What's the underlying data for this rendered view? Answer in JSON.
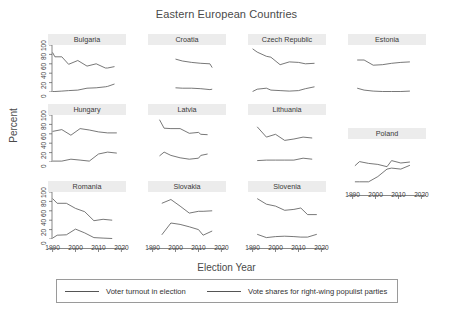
{
  "chart_data": {
    "type": "line",
    "title": "Eastern European Countries",
    "xlabel": "Election Year",
    "ylabel": "Percent",
    "xlim": [
      1988,
      2022
    ],
    "ylim": [
      0,
      100
    ],
    "xticks": [
      "1990",
      "2000",
      "2010",
      "2020"
    ],
    "yticks": [
      "0",
      "20",
      "40",
      "60",
      "80",
      "100"
    ],
    "grid": false,
    "legend_position": "bottom",
    "legend": [
      {
        "name": "Voter turnout in election"
      },
      {
        "name": "Vote shares for right-wing populist parties"
      }
    ],
    "layout": {
      "rows": 3,
      "cols": 4,
      "note": "small-multiples / faceted by country"
    },
    "panels": [
      {
        "country": "Bulgaria",
        "series": [
          {
            "name": "Voter turnout in election",
            "x": [
              1990,
              1991,
              1994,
              1997,
              2001,
              2005,
              2009,
              2013,
              2014,
              2017
            ],
            "values": [
              84,
              75,
              75,
              59,
              67,
              55,
              60,
              51,
              51,
              54
            ]
          },
          {
            "name": "Vote shares for right-wing populist parties",
            "x": [
              1990,
              1991,
              1994,
              1997,
              2001,
              2005,
              2009,
              2013,
              2014,
              2017
            ],
            "values": [
              1,
              1,
              2,
              3,
              4,
              8,
              9,
              11,
              12,
              17
            ]
          }
        ]
      },
      {
        "country": "Croatia",
        "series": [
          {
            "name": "Voter turnout in election",
            "x": [
              2000,
              2003,
              2007,
              2011,
              2015,
              2016
            ],
            "values": [
              70,
              66,
              63,
              61,
              60,
              52
            ]
          },
          {
            "name": "Vote shares for right-wing populist parties",
            "x": [
              2000,
              2003,
              2007,
              2011,
              2015,
              2016
            ],
            "values": [
              9,
              8,
              8,
              7,
              5,
              6
            ]
          }
        ]
      },
      {
        "country": "Czech Republic",
        "series": [
          {
            "name": "Voter turnout in election",
            "x": [
              1990,
              1992,
              1996,
              1998,
              2002,
              2006,
              2010,
              2013,
              2017
            ],
            "values": [
              92,
              85,
              76,
              74,
              58,
              64,
              63,
              60,
              61
            ]
          },
          {
            "name": "Vote shares for right-wing populist parties",
            "x": [
              1990,
              1992,
              1996,
              1998,
              2002,
              2006,
              2010,
              2013,
              2017
            ],
            "values": [
              1,
              6,
              8,
              4,
              3,
              2,
              3,
              7,
              11
            ]
          }
        ]
      },
      {
        "country": "Estonia",
        "series": [
          {
            "name": "Voter turnout in election",
            "x": [
              1992,
              1995,
              1999,
              2003,
              2007,
              2011,
              2015
            ],
            "values": [
              68,
              68,
              57,
              58,
              61,
              63,
              64
            ]
          },
          {
            "name": "Vote shares for right-wing populist parties",
            "x": [
              1992,
              1995,
              1999,
              2003,
              2007,
              2011,
              2015
            ],
            "values": [
              8,
              4,
              2,
              1,
              1,
              1,
              2
            ]
          }
        ]
      },
      {
        "country": "Hungary",
        "series": [
          {
            "name": "Voter turnout in election",
            "x": [
              1990,
              1994,
              1998,
              2002,
              2006,
              2010,
              2014,
              2018
            ],
            "values": [
              65,
              69,
              57,
              71,
              68,
              64,
              62,
              62
            ]
          },
          {
            "name": "Vote shares for right-wing populist parties",
            "x": [
              1990,
              1994,
              1998,
              2002,
              2006,
              2010,
              2014,
              2018
            ],
            "values": [
              2,
              2,
              6,
              4,
              2,
              17,
              21,
              19
            ]
          }
        ]
      },
      {
        "country": "Latvia",
        "series": [
          {
            "name": "Voter turnout in election",
            "x": [
              1993,
              1995,
              1998,
              2002,
              2006,
              2010,
              2011,
              2014
            ],
            "values": [
              90,
              72,
              71,
              71,
              61,
              63,
              59,
              58
            ]
          },
          {
            "name": "Vote shares for right-wing populist parties",
            "x": [
              1993,
              1995,
              1998,
              2002,
              2006,
              2010,
              2011,
              2014
            ],
            "values": [
              13,
              21,
              14,
              9,
              6,
              8,
              14,
              17
            ]
          }
        ]
      },
      {
        "country": "Lithuania",
        "series": [
          {
            "name": "Voter turnout in election",
            "x": [
              1992,
              1996,
              2000,
              2004,
              2008,
              2012,
              2016
            ],
            "values": [
              75,
              53,
              59,
              46,
              49,
              53,
              51
            ]
          },
          {
            "name": "Vote shares for right-wing populist parties",
            "x": [
              1992,
              1996,
              2000,
              2004,
              2008,
              2012,
              2016
            ],
            "values": [
              3,
              4,
              4,
              4,
              4,
              8,
              6
            ]
          }
        ]
      },
      {
        "country": "Poland",
        "series": [
          {
            "name": "Voter turnout in election",
            "x": [
              1991,
              1993,
              1997,
              2001,
              2005,
              2007,
              2011,
              2015
            ],
            "values": [
              43,
              52,
              48,
              46,
              41,
              54,
              49,
              51
            ]
          },
          {
            "name": "Vote shares for right-wing populist parties",
            "x": [
              1991,
              1993,
              1997,
              2001,
              2005,
              2007,
              2011,
              2015
            ],
            "values": [
              9,
              9,
              9,
              20,
              36,
              38,
              36,
              44
            ]
          }
        ]
      },
      {
        "country": "Romania",
        "series": [
          {
            "name": "Voter turnout in election",
            "x": [
              1990,
              1992,
              1996,
              2000,
              2004,
              2008,
              2012,
              2016
            ],
            "values": [
              86,
              76,
              76,
              65,
              58,
              39,
              42,
              40
            ]
          },
          {
            "name": "Vote shares for right-wing populist parties",
            "x": [
              1990,
              1992,
              1996,
              2000,
              2004,
              2008,
              2012,
              2016
            ],
            "values": [
              2,
              8,
              9,
              21,
              13,
              3,
              2,
              1
            ]
          }
        ]
      },
      {
        "country": "Slovakia",
        "series": [
          {
            "name": "Voter turnout in election",
            "x": [
              1994,
              1998,
              2002,
              2006,
              2010,
              2012,
              2016
            ],
            "values": [
              76,
              84,
              70,
              55,
              59,
              59,
              60
            ]
          },
          {
            "name": "Vote shares for right-wing populist parties",
            "x": [
              1994,
              1998,
              2002,
              2006,
              2010,
              2012,
              2016
            ],
            "values": [
              9,
              34,
              31,
              26,
              20,
              8,
              17
            ]
          }
        ]
      },
      {
        "country": "Slovenia",
        "series": [
          {
            "name": "Voter turnout in election",
            "x": [
              1992,
              1996,
              2000,
              2004,
              2008,
              2011,
              2014,
              2018
            ],
            "values": [
              86,
              74,
              70,
              61,
              63,
              66,
              52,
              52
            ]
          },
          {
            "name": "Vote shares for right-wing populist parties",
            "x": [
              1992,
              1996,
              2000,
              2004,
              2008,
              2011,
              2014,
              2018
            ],
            "values": [
              10,
              3,
              5,
              6,
              5,
              4,
              4,
              10
            ]
          }
        ]
      }
    ]
  }
}
